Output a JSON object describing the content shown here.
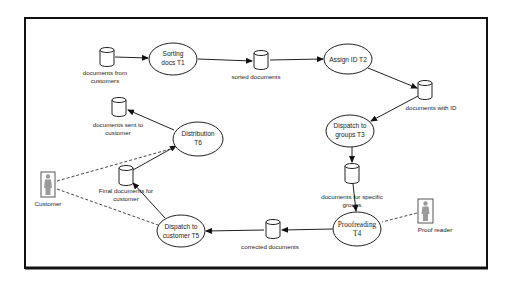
{
  "diagram": {
    "type": "data-flow",
    "colors": {
      "stroke": "#222222",
      "background": "#ffffff",
      "actor_figure": "#9a9a9a"
    },
    "processes": [
      {
        "id": "T1",
        "line1": "Sorting",
        "line2": "docs T1"
      },
      {
        "id": "T2",
        "line1": "Assign ID T2",
        "line2": ""
      },
      {
        "id": "T3",
        "line1": "Dispatch to",
        "line2": "groups T3"
      },
      {
        "id": "T4",
        "line1": "Proofreading",
        "line2": "T4"
      },
      {
        "id": "T5",
        "line1": "Dispatch to",
        "line2": "customer T5"
      },
      {
        "id": "T6",
        "line1": "Distribution",
        "line2": "T6"
      }
    ],
    "stores": [
      {
        "id": "s1",
        "line1": "documents from",
        "line2": "customers"
      },
      {
        "id": "s2",
        "line1": "sorted documents",
        "line2": ""
      },
      {
        "id": "s3",
        "line1": "documents with ID",
        "line2": ""
      },
      {
        "id": "s4",
        "line1": "documents for specific",
        "line2": "groups"
      },
      {
        "id": "s5",
        "line1": "corrected documents",
        "line2": ""
      },
      {
        "id": "s6",
        "line1": "Final documents for",
        "line2": "customer"
      },
      {
        "id": "s7",
        "line1": "documents sent to",
        "line2": "customer"
      }
    ],
    "actors": [
      {
        "id": "customer",
        "label": "Customer"
      },
      {
        "id": "proofreader",
        "label": "Proof reader"
      }
    ],
    "flows": [
      {
        "from": "documents from customers",
        "to": "Sorting docs T1"
      },
      {
        "from": "Sorting docs T1",
        "to": "sorted documents"
      },
      {
        "from": "sorted documents",
        "to": "Assign ID T2"
      },
      {
        "from": "Assign ID T2",
        "to": "documents with ID"
      },
      {
        "from": "documents with ID",
        "to": "Dispatch to groups T3"
      },
      {
        "from": "Dispatch to groups T3",
        "to": "documents for specific groups"
      },
      {
        "from": "documents for specific groups",
        "to": "Proofreading T4"
      },
      {
        "from": "Proofreading T4",
        "to": "corrected documents"
      },
      {
        "from": "corrected documents",
        "to": "Dispatch to customer T5"
      },
      {
        "from": "Dispatch to customer T5",
        "to": "Final documents for customer"
      },
      {
        "from": "Final documents for customer",
        "to": "Distribution T6"
      },
      {
        "from": "Distribution T6",
        "to": "documents sent to customer"
      }
    ],
    "associations": [
      {
        "actor": "Customer",
        "process": "Distribution T6"
      },
      {
        "actor": "Customer",
        "process": "Dispatch to customer T5"
      },
      {
        "actor": "Proof reader",
        "process": "Proofreading T4"
      }
    ]
  }
}
